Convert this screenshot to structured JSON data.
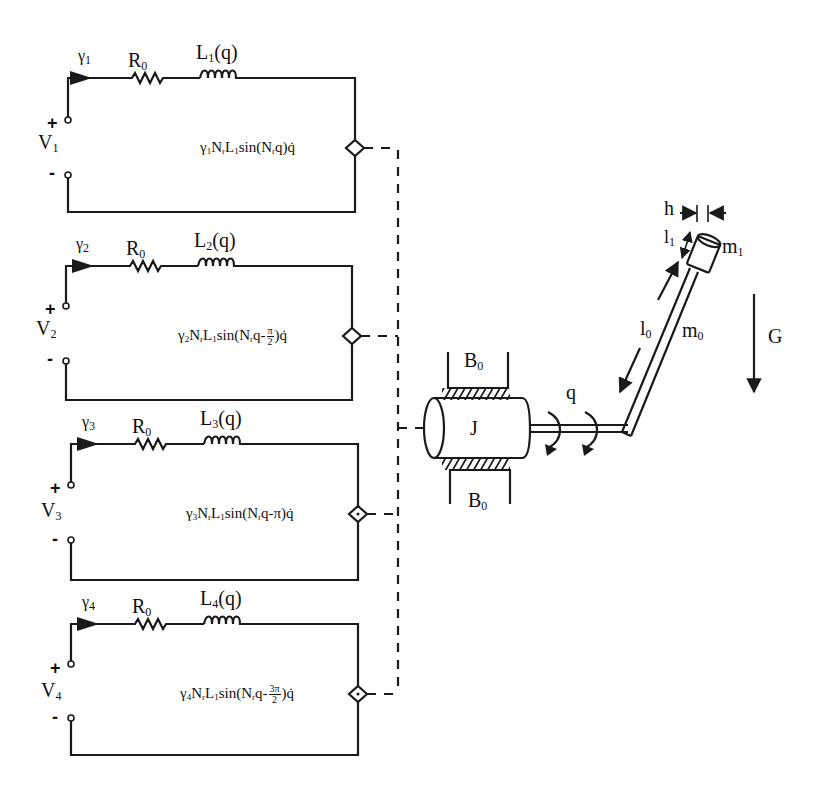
{
  "diagram": {
    "colors": {
      "ink": "#1a1a1a",
      "background": "#ffffff"
    },
    "circuits": [
      {
        "id": 1,
        "current": "γ",
        "current_sub": "1",
        "source": "V",
        "source_sub": "1",
        "plus": "+",
        "minus": "-",
        "resistor": "R",
        "resistor_sub": "0",
        "inductor": "L",
        "inductor_sub": "1",
        "inductor_arg": "(q)",
        "emf": {
          "prefix": "γ",
          "prefix_sub": "1",
          "body_a": "N",
          "body_a_sub": "r",
          "body_b": "L",
          "body_b_sub": "1",
          "func": "sin(N",
          "func_sub": "r",
          "arg": "q",
          "phase": "",
          "frac_num": "",
          "frac_den": "",
          "tail": ")q̇"
        }
      },
      {
        "id": 2,
        "current": "γ",
        "current_sub": "2",
        "source": "V",
        "source_sub": "2",
        "plus": "+",
        "minus": "-",
        "resistor": "R",
        "resistor_sub": "0",
        "inductor": "L",
        "inductor_sub": "2",
        "inductor_arg": "(q)",
        "emf": {
          "prefix": "γ",
          "prefix_sub": "2",
          "body_a": "N",
          "body_a_sub": "r",
          "body_b": "L",
          "body_b_sub": "1",
          "func": "sin(N",
          "func_sub": "r",
          "arg": "q-",
          "phase": "",
          "frac_num": "π",
          "frac_den": "2",
          "tail": ")q̇"
        }
      },
      {
        "id": 3,
        "current": "γ",
        "current_sub": "3",
        "source": "V",
        "source_sub": "3",
        "plus": "+",
        "minus": "-",
        "resistor": "R",
        "resistor_sub": "0",
        "inductor": "L",
        "inductor_sub": "3",
        "inductor_arg": "(q)",
        "emf": {
          "prefix": "γ",
          "prefix_sub": "3",
          "body_a": "N",
          "body_a_sub": "r",
          "body_b": "L",
          "body_b_sub": "1",
          "func": "sin(N",
          "func_sub": "r",
          "arg": "q-",
          "phase": "π",
          "frac_num": "",
          "frac_den": "",
          "tail": ")q̇"
        }
      },
      {
        "id": 4,
        "current": "γ",
        "current_sub": "4",
        "source": "V",
        "source_sub": "4",
        "plus": "+",
        "minus": "-",
        "resistor": "R",
        "resistor_sub": "0",
        "inductor": "L",
        "inductor_sub": "4",
        "inductor_arg": "(q)",
        "emf": {
          "prefix": "γ",
          "prefix_sub": "4",
          "body_a": "N",
          "body_a_sub": "r",
          "body_b": "L",
          "body_b_sub": "1",
          "func": "sin(N",
          "func_sub": "r",
          "arg": "q-",
          "phase": "",
          "frac_num": "3π",
          "frac_den": "2",
          "tail": ")q̇"
        }
      }
    ],
    "mechanical": {
      "rotor_label": "J",
      "bearing_top": {
        "label": "B",
        "sub": "0"
      },
      "bearing_bottom": {
        "label": "B",
        "sub": "0"
      },
      "angle_label": "q",
      "rod_length": {
        "label": "l",
        "sub": "0"
      },
      "rod_mass": {
        "label": "m",
        "sub": "0"
      },
      "tip_length": {
        "label": "l",
        "sub": "1"
      },
      "tip_width": {
        "label": "h"
      },
      "tip_mass": {
        "label": "m",
        "sub": "1"
      },
      "gravity": {
        "label": "G"
      }
    }
  }
}
